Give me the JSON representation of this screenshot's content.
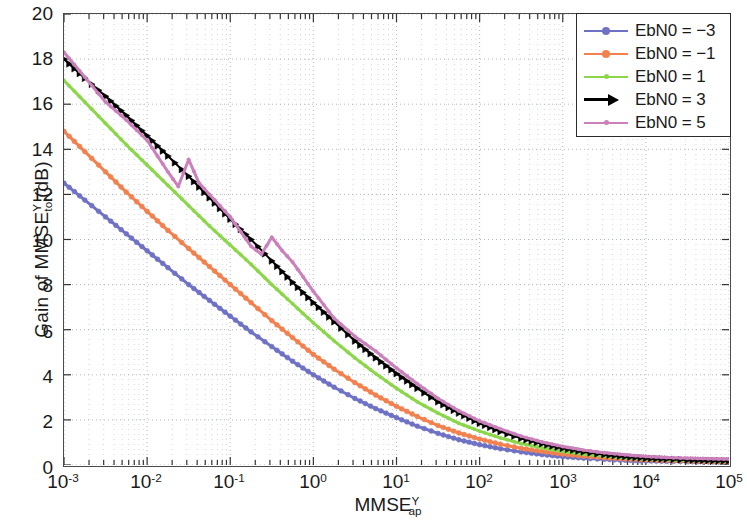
{
  "chart_data": {
    "type": "line",
    "title": "",
    "xlabel": "MMSE_ap^Y",
    "ylabel": "Gain of MMSE_tot^Y (dB)",
    "xscale": "log",
    "xlim": [
      0.001,
      100000
    ],
    "ylim": [
      0,
      20
    ],
    "ytick_step": 2,
    "grid": true,
    "grid_style": "dotted",
    "legend_position": "top-right",
    "xticks": [
      "10^-3",
      "10^-2",
      "10^-1",
      "10^0",
      "10^1",
      "10^2",
      "10^3",
      "10^4",
      "10^5"
    ],
    "yticks": [
      0,
      2,
      4,
      6,
      8,
      10,
      12,
      14,
      16,
      18,
      20
    ],
    "series": [
      {
        "name": "EbN0 = -3",
        "color": "#6f72c4",
        "marker": "circle",
        "x": [
          0.001,
          0.00178,
          0.00316,
          0.00562,
          0.01,
          0.0178,
          0.0316,
          0.0562,
          0.1,
          0.178,
          0.316,
          0.562,
          1,
          1.78,
          3.16,
          5.62,
          10,
          17.8,
          31.6,
          56.2,
          100,
          178,
          316,
          562,
          1000,
          1780,
          3160,
          5620,
          10000,
          17800,
          31600,
          56200,
          100000
        ],
        "y": [
          12.5,
          11.75,
          11.0,
          10.25,
          9.5,
          8.75,
          8.0,
          7.3,
          6.6,
          5.9,
          5.25,
          4.6,
          4.0,
          3.45,
          2.95,
          2.5,
          2.1,
          1.72,
          1.4,
          1.12,
          0.9,
          0.72,
          0.58,
          0.46,
          0.37,
          0.3,
          0.25,
          0.21,
          0.18,
          0.16,
          0.15,
          0.14,
          0.13
        ]
      },
      {
        "name": "EbN0 = -1",
        "color": "#f2814f",
        "marker": "circle",
        "x": [
          0.001,
          0.00178,
          0.00316,
          0.00562,
          0.01,
          0.0178,
          0.0316,
          0.0562,
          0.1,
          0.178,
          0.316,
          0.562,
          1,
          1.78,
          3.16,
          5.62,
          10,
          17.8,
          31.6,
          56.2,
          100,
          178,
          316,
          562,
          1000,
          1780,
          3160,
          5620,
          10000,
          17800,
          31600,
          56200,
          100000
        ],
        "y": [
          14.8,
          13.9,
          13.0,
          12.1,
          11.25,
          10.4,
          9.6,
          8.8,
          8.0,
          7.2,
          6.4,
          5.65,
          4.9,
          4.25,
          3.65,
          3.1,
          2.6,
          2.15,
          1.75,
          1.42,
          1.15,
          0.92,
          0.74,
          0.6,
          0.48,
          0.39,
          0.32,
          0.27,
          0.23,
          0.2,
          0.18,
          0.16,
          0.15
        ]
      },
      {
        "name": "EbN0 = 1",
        "color": "#8cd64a",
        "marker": "dot",
        "x": [
          0.001,
          0.00178,
          0.00316,
          0.00562,
          0.01,
          0.0178,
          0.0316,
          0.0562,
          0.1,
          0.178,
          0.316,
          0.562,
          1,
          1.78,
          3.16,
          5.62,
          10,
          17.8,
          31.6,
          56.2,
          100,
          178,
          316,
          562,
          1000,
          1780,
          3160,
          5620,
          10000,
          17800,
          31600,
          56200,
          100000
        ],
        "y": [
          17.05,
          16.1,
          15.15,
          14.2,
          13.3,
          12.4,
          11.5,
          10.6,
          9.75,
          8.9,
          8.0,
          7.15,
          6.3,
          5.5,
          4.75,
          4.05,
          3.4,
          2.8,
          2.3,
          1.85,
          1.5,
          1.2,
          0.95,
          0.76,
          0.6,
          0.48,
          0.39,
          0.32,
          0.27,
          0.23,
          0.2,
          0.18,
          0.16
        ]
      },
      {
        "name": "EbN0 = 3",
        "color": "#000000",
        "marker": "triangle-right",
        "x": [
          0.001,
          0.00178,
          0.00316,
          0.00562,
          0.01,
          0.0178,
          0.0316,
          0.0562,
          0.1,
          0.178,
          0.316,
          0.562,
          1,
          1.78,
          3.16,
          5.62,
          10,
          17.8,
          31.6,
          56.2,
          100,
          178,
          316,
          562,
          1000,
          1780,
          3160,
          5620,
          10000,
          17800,
          31600,
          56200,
          100000
        ],
        "y": [
          18.0,
          17.15,
          16.35,
          15.5,
          14.6,
          13.7,
          12.8,
          11.85,
          10.9,
          10.0,
          9.05,
          8.1,
          7.2,
          6.35,
          5.5,
          4.75,
          4.05,
          3.4,
          2.8,
          2.3,
          1.85,
          1.48,
          1.18,
          0.94,
          0.74,
          0.58,
          0.46,
          0.37,
          0.3,
          0.26,
          0.22,
          0.2,
          0.18
        ]
      },
      {
        "name": "EbN0 = 5",
        "color": "#cb80bb",
        "marker": "dot",
        "x": [
          0.001,
          0.00178,
          0.00316,
          0.00562,
          0.01,
          0.0178,
          0.0237,
          0.0316,
          0.0422,
          0.0562,
          0.1,
          0.178,
          0.237,
          0.316,
          0.422,
          0.562,
          1,
          1.78,
          3.16,
          5.62,
          10,
          17.8,
          31.6,
          56.2,
          100,
          178,
          316,
          562,
          1000,
          1780,
          3160,
          5620,
          10000,
          17800,
          31600,
          56200,
          100000
        ],
        "y": [
          18.3,
          17.2,
          16.1,
          15.3,
          14.4,
          13.0,
          12.35,
          13.55,
          12.5,
          12.0,
          11.0,
          9.7,
          9.35,
          10.1,
          9.5,
          9.0,
          7.7,
          6.5,
          5.7,
          5.05,
          4.3,
          3.6,
          2.95,
          2.4,
          1.95,
          1.6,
          1.28,
          1.02,
          0.82,
          0.66,
          0.54,
          0.45,
          0.38,
          0.33,
          0.3,
          0.28,
          0.26
        ]
      }
    ]
  },
  "axes": {
    "ylabel_prefix": "Gain of MMSE",
    "ylabel_sup": "Y",
    "ylabel_sub": "tot",
    "ylabel_suffix": "(dB)",
    "xlabel_base": "MMSE",
    "xlabel_sup": "Y",
    "xlabel_sub": "ap",
    "ytick_labels": [
      "20",
      "18",
      "16",
      "14",
      "12",
      "10",
      "8",
      "6",
      "4",
      "2",
      "0"
    ],
    "xtick_mantissa": "10",
    "xtick_exponents": [
      "-3",
      "-2",
      "-1",
      "0",
      "1",
      "2",
      "3",
      "4",
      "5"
    ]
  },
  "legend": {
    "items": [
      {
        "label": "EbN0 = −3",
        "color": "#6f72c4",
        "marker": "circle"
      },
      {
        "label": "EbN0 = −1",
        "color": "#f2814f",
        "marker": "circle"
      },
      {
        "label": "EbN0 = 1",
        "color": "#8cd64a",
        "marker": "dot"
      },
      {
        "label": "EbN0 = 3",
        "color": "#000000",
        "marker": "triangle-right"
      },
      {
        "label": "EbN0 = 5",
        "color": "#cb80bb",
        "marker": "dot"
      }
    ]
  },
  "colors": {
    "axis": "#4a4a4a",
    "grid": "#9aa0b4",
    "background": "#ffffff"
  }
}
